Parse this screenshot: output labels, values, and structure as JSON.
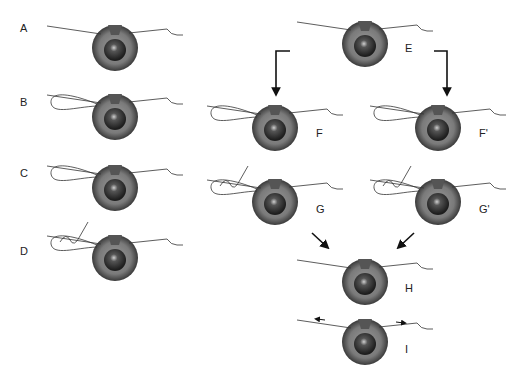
{
  "colors": {
    "thread": "#333333",
    "iris": "#6e6e6e",
    "pupil": "#2a2a2a",
    "arrow": "#111111"
  },
  "panels": [
    {
      "id": "A",
      "label": "A",
      "step": "single pass"
    },
    {
      "id": "B",
      "label": "B",
      "step": "needle pass"
    },
    {
      "id": "C",
      "label": "C",
      "step": "loop formed"
    },
    {
      "id": "D",
      "label": "D",
      "step": "knot throw"
    },
    {
      "id": "E",
      "label": "E",
      "step": "start branch"
    },
    {
      "id": "F",
      "label": "F",
      "step": "loop left"
    },
    {
      "id": "Fp",
      "label": "F'",
      "step": "loop alt"
    },
    {
      "id": "G",
      "label": "G",
      "step": "knot"
    },
    {
      "id": "Gp",
      "label": "G'",
      "step": "knot alt"
    },
    {
      "id": "H",
      "label": "H",
      "step": "tied"
    },
    {
      "id": "I",
      "label": "I",
      "step": "tension"
    }
  ]
}
